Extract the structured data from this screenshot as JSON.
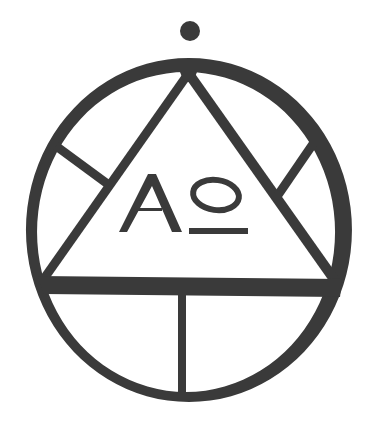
{
  "symbol": {
    "description": "Circle with inscribed triangle, dot above, and Alpha-Omega monogram",
    "ink_color": "#3a3a3a",
    "background_color": "#ffffff",
    "monogram": {
      "alpha": "A",
      "omega": "o"
    }
  }
}
